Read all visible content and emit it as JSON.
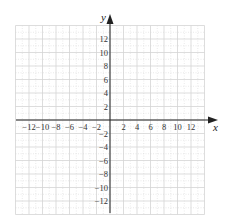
{
  "chart_data": {
    "type": "scatter",
    "title": "",
    "xlabel": "x",
    "ylabel": "y",
    "xlim": [
      -14,
      14
    ],
    "ylim": [
      -14,
      14
    ],
    "grid": true,
    "grid_step": 2,
    "legend": null,
    "series": [],
    "x_ticks": [
      -12,
      -10,
      -8,
      -6,
      -4,
      -2,
      2,
      4,
      6,
      8,
      10,
      12
    ],
    "y_ticks": [
      12,
      10,
      8,
      6,
      4,
      2,
      -2,
      -4,
      -6,
      -8,
      -10,
      -12
    ],
    "x_tick_labels": [
      "−12",
      "−10",
      "−8",
      "−6",
      "−4",
      "−2",
      "2",
      "4",
      "6",
      "8",
      "10",
      "12"
    ],
    "y_tick_labels": [
      "12",
      "10",
      "8",
      "6",
      "4",
      "2",
      "−2",
      "−4",
      "−6",
      "−8",
      "−10",
      "−12"
    ]
  },
  "axes": {
    "x_label": "x",
    "y_label": "y"
  },
  "colors": {
    "grid": "#d4d4d4",
    "axis": "#222222",
    "text": "#333333"
  }
}
